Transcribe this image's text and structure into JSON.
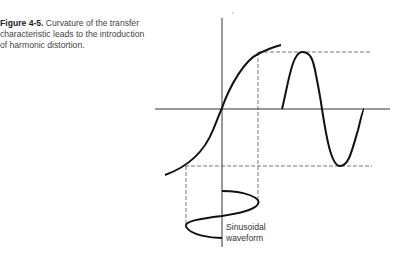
{
  "figure": {
    "number": "Figure 4-5.",
    "caption": " Curvature of the transfer characteristic leads to the introduction of harmonic distortion."
  },
  "diagram": {
    "input_label_line1": "Sinusoidal",
    "input_label_line2": "waveform",
    "stroke_color": "#111111",
    "dash_color": "#555555"
  }
}
